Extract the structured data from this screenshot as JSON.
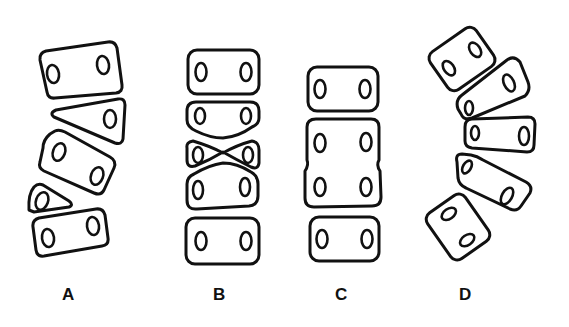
{
  "figure": {
    "panels": [
      {
        "label": "A",
        "description": "vertebral bodies tilted with wedge-shaped segments"
      },
      {
        "label": "B",
        "description": "stacked vertebrae with biconcave/bowtie deformed middle segments"
      },
      {
        "label": "C",
        "description": "fused block of two vertebrae between normal vertebrae"
      },
      {
        "label": "D",
        "description": "curved arc of overlapping wedged vertebrae"
      }
    ]
  }
}
